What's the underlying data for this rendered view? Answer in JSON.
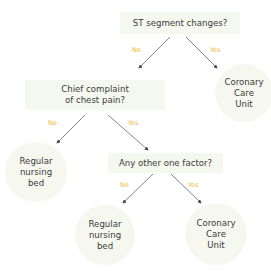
{
  "diagram": {
    "type": "decision-tree",
    "nodes": {
      "q1": {
        "text": "ST segment changes?"
      },
      "q2": {
        "line1": "Chief complaint",
        "line2": "of chest pain?"
      },
      "q3": {
        "text": "Any other one factor?"
      },
      "ccu1": {
        "line1": "Coronary",
        "line2": "Care",
        "line3": "Unit"
      },
      "bed1": {
        "line1": "Regular",
        "line2": "nursing",
        "line3": "bed"
      },
      "bed2": {
        "line1": "Regular",
        "line2": "nursing",
        "line3": "bed"
      },
      "ccu2": {
        "line1": "Coronary",
        "line2": "Care",
        "line3": "Unit"
      }
    },
    "edges": [
      {
        "from": "q1",
        "to": "q2",
        "label": "No"
      },
      {
        "from": "q1",
        "to": "ccu1",
        "label": "Yes"
      },
      {
        "from": "q2",
        "to": "bed1",
        "label": "No"
      },
      {
        "from": "q2",
        "to": "q3",
        "label": "Yes"
      },
      {
        "from": "q3",
        "to": "bed2",
        "label": "No"
      },
      {
        "from": "q3",
        "to": "ccu2",
        "label": "Yes"
      }
    ],
    "colors": {
      "label": "#f0b838",
      "node_fill": "#f5f8ee",
      "arrow": "#555555",
      "text": "#3b3b3b"
    }
  }
}
